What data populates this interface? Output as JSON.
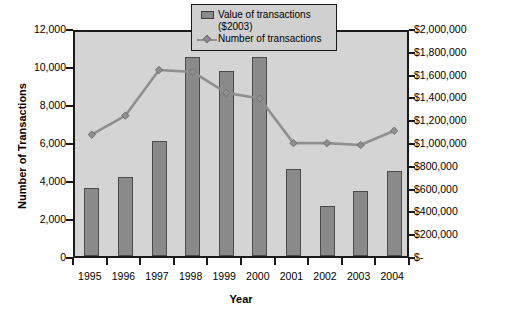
{
  "chart_data": {
    "type": "bar",
    "title": "",
    "xlabel": "Year",
    "ylabel": "Number of Transactions",
    "y2label": "Value of Transactions ($ millions)",
    "categories": [
      "1995",
      "1996",
      "1997",
      "1998",
      "1999",
      "2000",
      "2001",
      "2002",
      "2003",
      "2004"
    ],
    "grid": false,
    "legend_position": "top-right",
    "ylim": [
      0,
      12000
    ],
    "y2lim": [
      0,
      2000000
    ],
    "yticks": [
      "0",
      "2,000",
      "4,000",
      "6,000",
      "8,000",
      "10,000",
      "12,000"
    ],
    "ytick_values": [
      0,
      2000,
      4000,
      6000,
      8000,
      10000,
      12000
    ],
    "y2ticks": [
      "$-",
      "$200,000",
      "$400,000",
      "$600,000",
      "$800,000",
      "$1,000,000",
      "$1,200,000",
      "$1,400,000",
      "$1,600,000",
      "$1,800,000",
      "$2,000,000"
    ],
    "y2tick_values": [
      0,
      200000,
      400000,
      600000,
      800000,
      1000000,
      1200000,
      1400000,
      1600000,
      1800000,
      2000000
    ],
    "series": [
      {
        "name": "Value of transactions ($2003)",
        "type": "bar",
        "axis": "right",
        "color": "#8a8a8a",
        "values": [
          600000,
          692000,
          1008000,
          1750000,
          1625000,
          1742000,
          767000,
          442000,
          567000,
          742000
        ]
      },
      {
        "name": "Number of transactions",
        "type": "line",
        "axis": "left",
        "color": "#8f8f8f",
        "values": [
          6600,
          7600,
          10000,
          9900,
          8800,
          8500,
          6150,
          6150,
          6050,
          6800
        ]
      }
    ],
    "legend": [
      {
        "label_line1": "Value of transactions",
        "label_line2": "($2003)",
        "marker": "bar-swatch-icon"
      },
      {
        "label_line1": "Number of transactions",
        "label_line2": "",
        "marker": "line-diamond-icon"
      }
    ]
  }
}
